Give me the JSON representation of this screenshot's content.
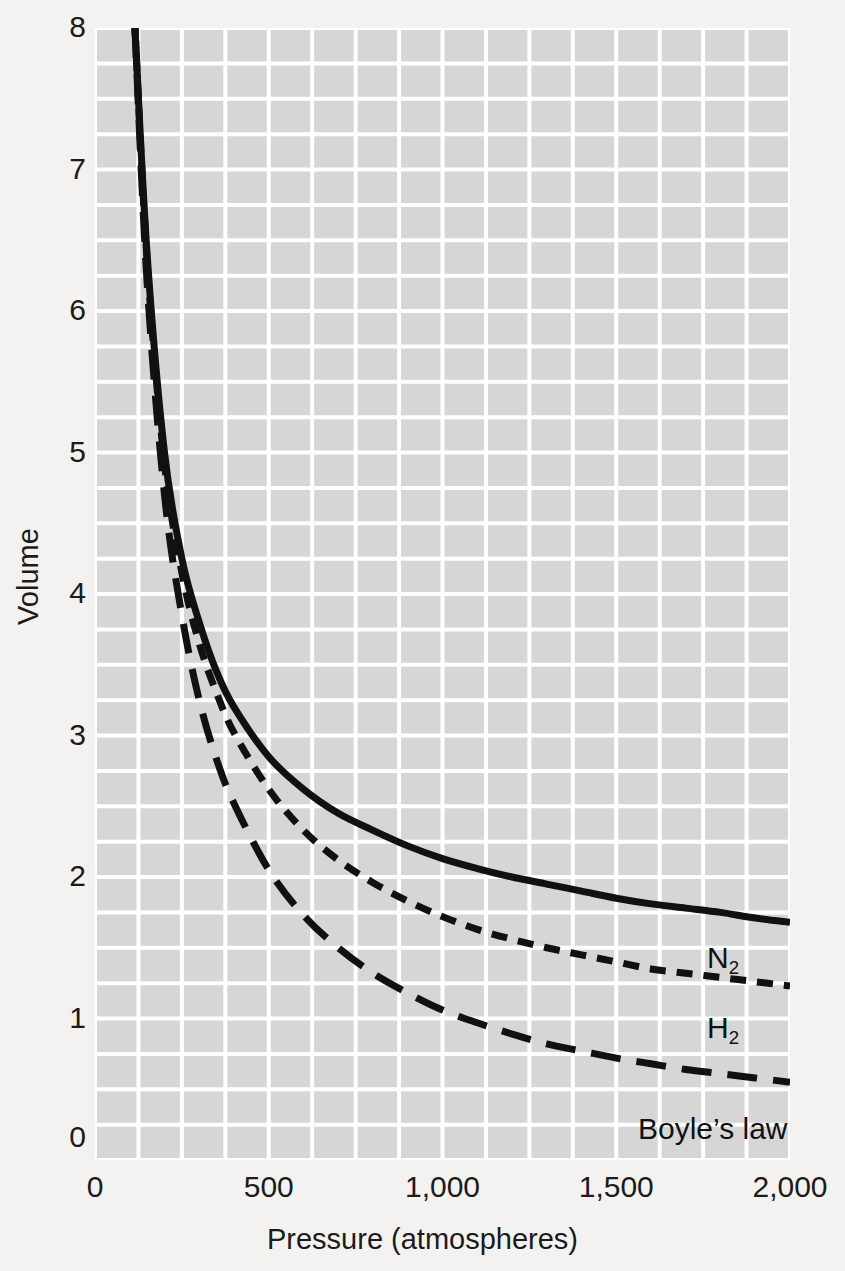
{
  "chart_data": {
    "type": "line",
    "title": "",
    "xlabel": "Pressure (atmospheres)",
    "ylabel": "Volume",
    "xlim": [
      0,
      2000
    ],
    "ylim": [
      0,
      8
    ],
    "grid": true,
    "grid_step_x": 125,
    "grid_step_y": 0.25,
    "xticks": [
      0,
      500,
      1000,
      1500,
      2000
    ],
    "xtick_labels": [
      "0",
      "500",
      "1,000",
      "1,500",
      "2,000"
    ],
    "yticks": [
      0,
      1,
      2,
      3,
      4,
      5,
      6,
      7,
      8
    ],
    "ytick_labels": [
      "0",
      "1",
      "2",
      "3",
      "4",
      "5",
      "6",
      "7",
      "8"
    ],
    "legend_position": "inline-right",
    "background_color": "#d6d6d6",
    "gridline_color": "#ffffff",
    "curve_color": "#111111",
    "series": [
      {
        "name": "N2",
        "label_html": "N<sub>2</sub>",
        "label_text": "N2",
        "style": "solid",
        "x": [
          115,
          150,
          200,
          250,
          300,
          350,
          400,
          500,
          600,
          700,
          800,
          900,
          1000,
          1100,
          1200,
          1300,
          1400,
          1500,
          1600,
          1700,
          1800,
          1900,
          2000
        ],
        "y": [
          8.0,
          6.4,
          5.0,
          4.25,
          3.8,
          3.45,
          3.2,
          2.85,
          2.62,
          2.45,
          2.33,
          2.22,
          2.13,
          2.06,
          2.0,
          1.95,
          1.9,
          1.85,
          1.81,
          1.78,
          1.75,
          1.71,
          1.68
        ]
      },
      {
        "name": "H2",
        "label_html": "H<sub>2</sub>",
        "label_text": "H2",
        "style": "short-dash",
        "x": [
          115,
          150,
          200,
          250,
          300,
          350,
          400,
          500,
          600,
          700,
          800,
          900,
          1000,
          1100,
          1200,
          1300,
          1400,
          1500,
          1600,
          1700,
          1800,
          1900,
          2000
        ],
        "y": [
          8.0,
          6.35,
          4.92,
          4.15,
          3.65,
          3.3,
          3.02,
          2.62,
          2.33,
          2.12,
          1.96,
          1.83,
          1.72,
          1.63,
          1.56,
          1.5,
          1.45,
          1.4,
          1.35,
          1.32,
          1.29,
          1.26,
          1.23
        ]
      },
      {
        "name": "Boyle's law",
        "label_html": "Boyle’s law",
        "label_text": "Boyle’s law",
        "style": "long-dash",
        "x": [
          115,
          150,
          200,
          250,
          300,
          350,
          400,
          500,
          600,
          700,
          800,
          900,
          1000,
          1100,
          1200,
          1300,
          1400,
          1500,
          1600,
          1700,
          1800,
          1900,
          2000
        ],
        "y": [
          8.0,
          6.2,
          4.7,
          3.85,
          3.25,
          2.83,
          2.52,
          2.05,
          1.73,
          1.5,
          1.32,
          1.18,
          1.06,
          0.97,
          0.89,
          0.82,
          0.77,
          0.72,
          0.68,
          0.64,
          0.61,
          0.58,
          0.55
        ]
      }
    ]
  },
  "axes": {
    "y_origin_label": "0",
    "x_origin_label": "0"
  }
}
